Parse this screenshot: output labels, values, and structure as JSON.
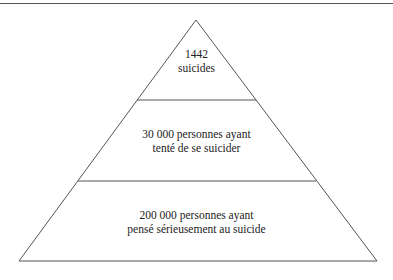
{
  "pyramid": {
    "levels": [
      {
        "line1": "1442",
        "line2": "suicides"
      },
      {
        "line1": "30 000 personnes ayant",
        "line2": "tenté de se suicider"
      },
      {
        "line1": "200 000 personnes ayant",
        "line2": "pensé sérieusement au suicide"
      }
    ],
    "stroke_color": "#555555"
  }
}
